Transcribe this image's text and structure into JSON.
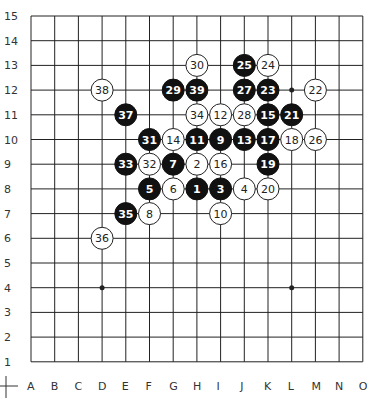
{
  "board": {
    "size": 15,
    "columns": [
      "A",
      "B",
      "C",
      "D",
      "E",
      "F",
      "G",
      "H",
      "I",
      "J",
      "K",
      "L",
      "M",
      "N",
      "O"
    ],
    "rows": [
      "15",
      "14",
      "13",
      "12",
      "11",
      "10",
      "9",
      "8",
      "7",
      "6",
      "5",
      "4",
      "3",
      "2",
      "1"
    ],
    "star_points": [
      [
        "D",
        "4"
      ],
      [
        "L",
        "4"
      ],
      [
        "L",
        "12"
      ]
    ],
    "colors": {
      "line": "#222222",
      "black": "#111111",
      "white": "#ffffff",
      "background": "#ffffff"
    }
  },
  "stones": [
    {
      "n": "1",
      "color": "black",
      "col": "H",
      "row": 8
    },
    {
      "n": "2",
      "color": "white",
      "col": "H",
      "row": 9
    },
    {
      "n": "3",
      "color": "black",
      "col": "I",
      "row": 8
    },
    {
      "n": "4",
      "color": "white",
      "col": "J",
      "row": 8
    },
    {
      "n": "5",
      "color": "black",
      "col": "F",
      "row": 8
    },
    {
      "n": "6",
      "color": "white",
      "col": "G",
      "row": 8
    },
    {
      "n": "7",
      "color": "black",
      "col": "G",
      "row": 9
    },
    {
      "n": "8",
      "color": "white",
      "col": "F",
      "row": 7
    },
    {
      "n": "9",
      "color": "black",
      "col": "I",
      "row": 10
    },
    {
      "n": "10",
      "color": "white",
      "col": "I",
      "row": 7
    },
    {
      "n": "11",
      "color": "black",
      "col": "H",
      "row": 10
    },
    {
      "n": "12",
      "color": "white",
      "col": "I",
      "row": 11
    },
    {
      "n": "13",
      "color": "black",
      "col": "J",
      "row": 10
    },
    {
      "n": "14",
      "color": "white",
      "col": "G",
      "row": 10
    },
    {
      "n": "15",
      "color": "black",
      "col": "K",
      "row": 11
    },
    {
      "n": "16",
      "color": "white",
      "col": "I",
      "row": 9
    },
    {
      "n": "17",
      "color": "black",
      "col": "K",
      "row": 10
    },
    {
      "n": "18",
      "color": "white",
      "col": "L",
      "row": 10
    },
    {
      "n": "19",
      "color": "black",
      "col": "K",
      "row": 9
    },
    {
      "n": "20",
      "color": "white",
      "col": "K",
      "row": 8
    },
    {
      "n": "21",
      "color": "black",
      "col": "L",
      "row": 11
    },
    {
      "n": "22",
      "color": "white",
      "col": "M",
      "row": 12
    },
    {
      "n": "23",
      "color": "black",
      "col": "K",
      "row": 12
    },
    {
      "n": "24",
      "color": "white",
      "col": "K",
      "row": 13
    },
    {
      "n": "25",
      "color": "black",
      "col": "J",
      "row": 13
    },
    {
      "n": "26",
      "color": "white",
      "col": "M",
      "row": 10
    },
    {
      "n": "27",
      "color": "black",
      "col": "J",
      "row": 12
    },
    {
      "n": "28",
      "color": "white",
      "col": "J",
      "row": 11
    },
    {
      "n": "29",
      "color": "black",
      "col": "G",
      "row": 12
    },
    {
      "n": "30",
      "color": "white",
      "col": "H",
      "row": 13
    },
    {
      "n": "31",
      "color": "black",
      "col": "F",
      "row": 10
    },
    {
      "n": "32",
      "color": "white",
      "col": "F",
      "row": 9
    },
    {
      "n": "33",
      "color": "black",
      "col": "E",
      "row": 9
    },
    {
      "n": "34",
      "color": "white",
      "col": "H",
      "row": 11
    },
    {
      "n": "35",
      "color": "black",
      "col": "E",
      "row": 7
    },
    {
      "n": "36",
      "color": "white",
      "col": "D",
      "row": 6
    },
    {
      "n": "37",
      "color": "black",
      "col": "E",
      "row": 11
    },
    {
      "n": "38",
      "color": "white",
      "col": "D",
      "row": 12
    },
    {
      "n": "39",
      "color": "black",
      "col": "H",
      "row": 12
    }
  ]
}
